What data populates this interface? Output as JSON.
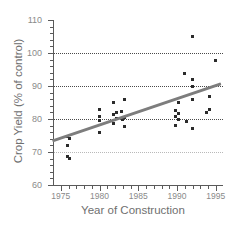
{
  "chart_data": {
    "type": "scatter",
    "title": "",
    "xlabel": "Year of Construction",
    "ylabel": "Crop Yield (% of control)",
    "xlim": [
      1974,
      1995.8
    ],
    "ylim": [
      60,
      110
    ],
    "grid": true,
    "gridlines_y": [
      70,
      80,
      90,
      100
    ],
    "legend": "none",
    "xticks": [
      1975,
      1980,
      1985,
      1990,
      1995
    ],
    "xtick_labels": [
      "1975",
      "1980",
      "1985",
      "1990",
      "1995"
    ],
    "yticks": [
      60,
      70,
      80,
      90,
      100,
      110
    ],
    "ytick_labels": [
      "60",
      "70",
      "80",
      "90",
      "100",
      "110"
    ],
    "x": [
      1976,
      1976,
      1976,
      1976,
      1976,
      1980,
      1980,
      1980,
      1980,
      1982,
      1982,
      1982,
      1982,
      1982,
      1983,
      1983,
      1983,
      1983,
      1983,
      1990,
      1990,
      1990,
      1990,
      1990,
      1990,
      1991,
      1991,
      1992,
      1992,
      1992,
      1992,
      1992,
      1994,
      1994,
      1994,
      1995
    ],
    "y": [
      74.6,
      74.2,
      72.1,
      68.6,
      68.0,
      82.8,
      80.9,
      79.6,
      75.8,
      85.0,
      82.0,
      81.4,
      80.2,
      78.6,
      85.8,
      82.4,
      80.4,
      79.8,
      77.8,
      85.0,
      82.6,
      81.6,
      80.8,
      79.8,
      78.0,
      93.8,
      79.2,
      105.0,
      92.0,
      89.8,
      86.0,
      77.2,
      86.8,
      82.8,
      82.0,
      97.8
    ],
    "series": [
      {
        "name": "Crop yield observations",
        "marker": "square",
        "color": "#2b2b2b",
        "size": 3
      }
    ],
    "trend_line": {
      "name": "linear regression",
      "color": "#7d7d7d",
      "width": 3.2,
      "x_start": 1974,
      "y_start": 73.2,
      "x_end": 1995.8,
      "y_end": 90.6
    }
  },
  "axes": {
    "y_title": "Crop Yield (% of control)",
    "x_title": "Year of Construction"
  }
}
